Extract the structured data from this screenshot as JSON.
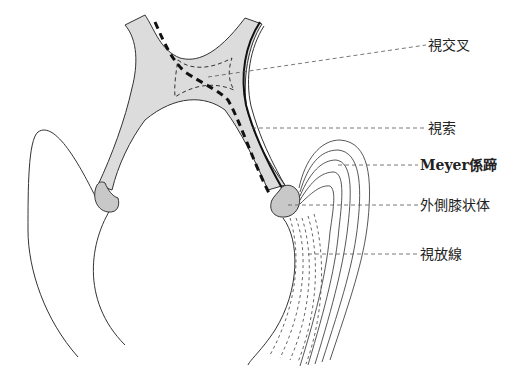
{
  "diagram": {
    "type": "anatomical-illustration",
    "colors": {
      "fill_gray": "#d9d9d9",
      "outline": "#333333",
      "background": "#ffffff"
    },
    "labels": [
      {
        "id": "optic-chiasm",
        "text": "視交叉",
        "x": 428,
        "y": 37
      },
      {
        "id": "optic-tract",
        "text": "視索",
        "x": 428,
        "y": 121
      },
      {
        "id": "meyer-loop",
        "text": "Meyer係蹄",
        "x": 420,
        "y": 157
      },
      {
        "id": "lateral-geniculate-body",
        "text": "外側膝状体",
        "x": 420,
        "y": 198
      },
      {
        "id": "optic-radiation",
        "text": "視放線",
        "x": 420,
        "y": 247
      }
    ]
  }
}
